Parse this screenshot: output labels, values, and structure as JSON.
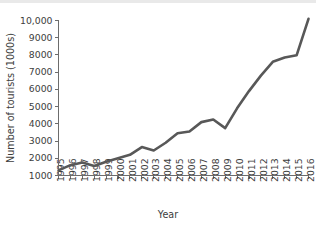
{
  "chart_data": {
    "type": "line",
    "title": "",
    "xlabel": "Year",
    "ylabel": "Number of tourists (1000s)",
    "categories": [
      "1995",
      "1996",
      "1997",
      "1998",
      "1999",
      "2000",
      "2001",
      "2002",
      "2003",
      "2004",
      "2005",
      "2006",
      "2007",
      "2008",
      "2009",
      "2010",
      "2011",
      "2012",
      "2013",
      "2014",
      "2015",
      "2016"
    ],
    "values": [
      1300,
      1600,
      1750,
      1550,
      1800,
      2000,
      2200,
      2650,
      2450,
      2900,
      3450,
      3550,
      4100,
      4250,
      3750,
      4900,
      5900,
      6800,
      7600,
      7850,
      7980,
      10100
    ],
    "series": [
      {
        "name": "Number of tourists",
        "values": [
          1300,
          1600,
          1750,
          1550,
          1800,
          2000,
          2200,
          2650,
          2450,
          2900,
          3450,
          3550,
          4100,
          4250,
          3750,
          4900,
          5900,
          6800,
          7600,
          7850,
          7980,
          10100
        ]
      }
    ],
    "ytick_labels": [
      "1000",
      "2000",
      "3000",
      "4000",
      "5000",
      "6000",
      "7000",
      "8000",
      "9000",
      "10,000"
    ],
    "ytick_values": [
      1000,
      2000,
      3000,
      4000,
      5000,
      6000,
      7000,
      8000,
      9000,
      10000
    ],
    "ylim": [
      1000,
      10000
    ],
    "xlim": [
      "1995",
      "2016"
    ],
    "grid": false,
    "legend": false,
    "legend_position": "none",
    "line_color": "#585858",
    "axis_color": "#6c6c6c",
    "background_color": "#ffffff"
  }
}
